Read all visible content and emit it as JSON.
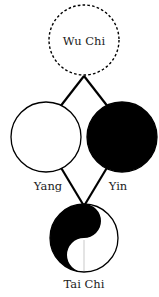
{
  "diagram": {
    "nodes": [
      {
        "id": "wu_chi",
        "label": "Wu Chi",
        "style": "dashed-outline"
      },
      {
        "id": "yang",
        "label": "Yang",
        "style": "white-fill"
      },
      {
        "id": "yin",
        "label": "Yin",
        "style": "black-fill"
      },
      {
        "id": "tai_chi",
        "label": "Tai Chi",
        "style": "yin-yang"
      }
    ],
    "edges": [
      {
        "from": "wu_chi",
        "to": "yang"
      },
      {
        "from": "wu_chi",
        "to": "yin"
      },
      {
        "from": "yang",
        "to": "tai_chi"
      },
      {
        "from": "yin",
        "to": "tai_chi"
      }
    ],
    "colors": {
      "ink": "#000000",
      "background": "#ffffff",
      "text": "#222222",
      "divider": "#bbbbbb"
    }
  },
  "labels": {
    "wu_chi": "Wu Chi",
    "yang": "Yang",
    "yin": "Yin",
    "tai_chi": "Tai Chi"
  }
}
